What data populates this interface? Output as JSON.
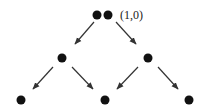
{
  "diagram": {
    "type": "binary-tree-lattice",
    "root_label": "(1,0)",
    "nodes": [
      {
        "id": "root-a",
        "x": 97,
        "y": 15,
        "level": 0
      },
      {
        "id": "root-b",
        "x": 109,
        "y": 15,
        "level": 0
      },
      {
        "id": "mid-left",
        "x": 62,
        "y": 58,
        "level": 1
      },
      {
        "id": "mid-right",
        "x": 148,
        "y": 58,
        "level": 1
      },
      {
        "id": "bot-left",
        "x": 21,
        "y": 100,
        "level": 2
      },
      {
        "id": "bot-center",
        "x": 105,
        "y": 100,
        "level": 2
      },
      {
        "id": "bot-right",
        "x": 189,
        "y": 100,
        "level": 2
      }
    ],
    "edges": [
      {
        "from": "root",
        "to": "mid-left"
      },
      {
        "from": "root",
        "to": "mid-right"
      },
      {
        "from": "mid-left",
        "to": "bot-left"
      },
      {
        "from": "mid-left",
        "to": "bot-center"
      },
      {
        "from": "mid-right",
        "to": "bot-center"
      },
      {
        "from": "mid-right",
        "to": "bot-right"
      }
    ],
    "colors": {
      "node": "#111111",
      "edge": "#333333",
      "text": "#222222"
    }
  }
}
